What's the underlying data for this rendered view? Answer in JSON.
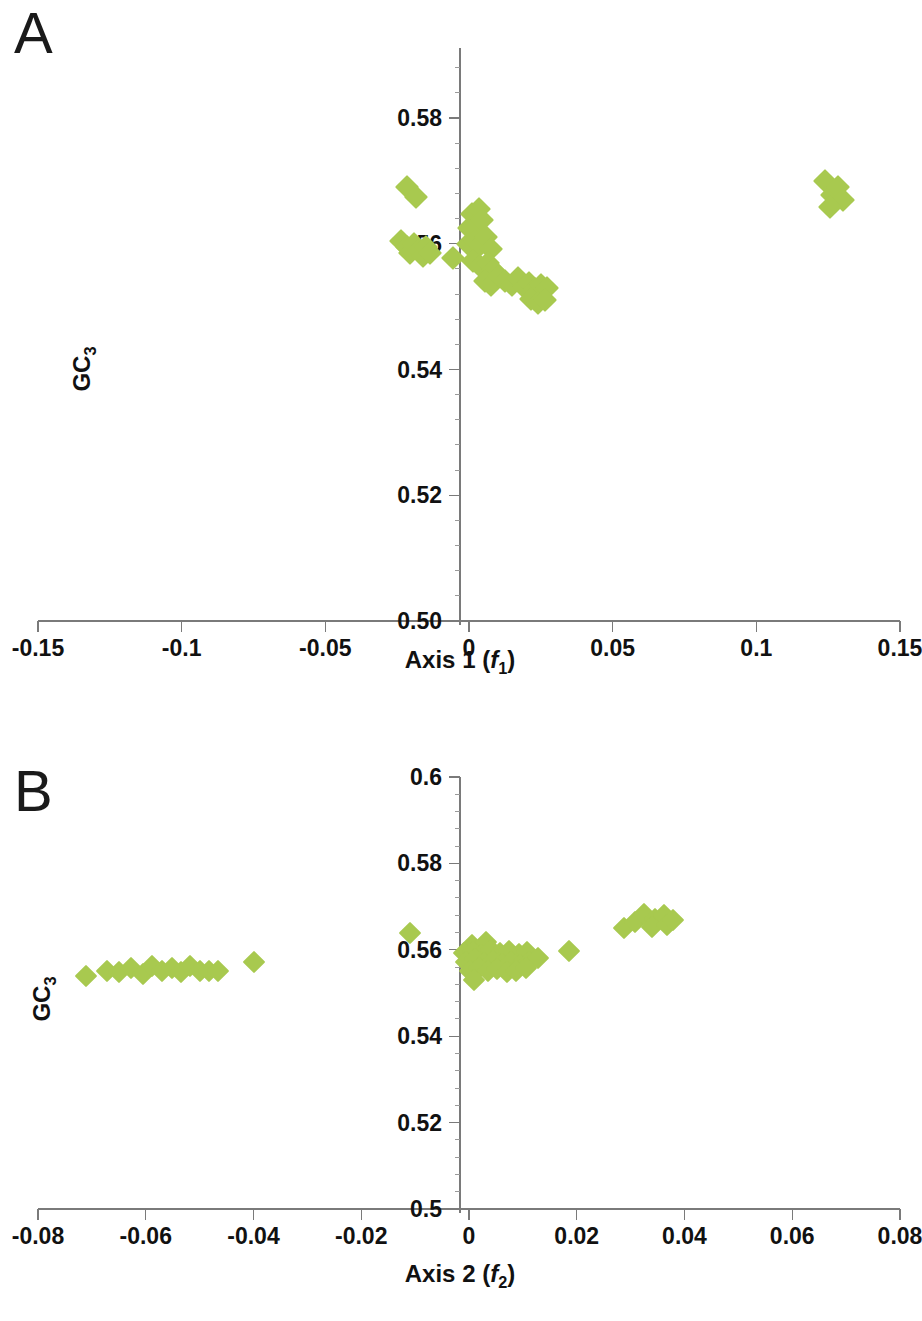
{
  "figure": {
    "marker_color": "#a8c94f",
    "axis_color": "#7a7a7a",
    "text_color": "#111111"
  },
  "panels": [
    {
      "letter": "A",
      "ylabel_text": "GC",
      "ylabel_sub": "3",
      "xtitle_prefix": "Axis 1 (",
      "xtitle_italic": "f",
      "xtitle_sub": "1",
      "xtitle_suffix": ")",
      "xticks": [
        "-0.15",
        "-0.1",
        "-0.05",
        "0",
        "0.05",
        "0.1",
        "0.15"
      ],
      "yticks": [
        "0.58",
        "0.56",
        "0.54",
        "0.52",
        "0.50"
      ]
    },
    {
      "letter": "B",
      "ylabel_text": "GC",
      "ylabel_sub": "3",
      "xtitle_prefix": "Axis 2 (",
      "xtitle_italic": "f",
      "xtitle_sub": "2",
      "xtitle_suffix": ")",
      "xticks": [
        "-0.08",
        "-0.06",
        "-0.04",
        "-0.02",
        "0",
        "0.02",
        "0.04",
        "0.06",
        "0.08"
      ],
      "yticks": [
        "0.6",
        "0.58",
        "0.56",
        "0.54",
        "0.52",
        "0.5"
      ]
    }
  ],
  "chart_data": [
    {
      "type": "scatter",
      "title": "A",
      "xlabel": "Axis 1 (f1)",
      "ylabel": "GC3",
      "xlim": [
        -0.15,
        0.15
      ],
      "ylim": [
        0.5,
        0.588
      ],
      "xticks": [
        -0.15,
        -0.1,
        -0.05,
        0,
        0.05,
        0.1,
        0.15
      ],
      "yticks": [
        0.5,
        0.52,
        0.54,
        0.56,
        0.58
      ],
      "xtick_labels": [
        "-0.15",
        "-0.1",
        "-0.05",
        "0",
        "0.05",
        "0.1",
        "0.15"
      ],
      "ytick_labels": [
        "0.50",
        "0.52",
        "0.54",
        "0.56",
        "0.58"
      ],
      "grid": false,
      "legend": "none",
      "series": [
        {
          "name": "genes",
          "marker": "diamond",
          "color": "#a8c94f",
          "points": [
            [
              -0.0215,
              0.569
            ],
            [
              -0.0185,
              0.5675
            ],
            [
              -0.0235,
              0.5605
            ],
            [
              -0.0215,
              0.5595
            ],
            [
              -0.0205,
              0.5585
            ],
            [
              -0.019,
              0.56
            ],
            [
              -0.0175,
              0.559
            ],
            [
              -0.016,
              0.558
            ],
            [
              -0.015,
              0.5595
            ],
            [
              -0.0135,
              0.5585
            ],
            [
              -0.0055,
              0.5578
            ],
            [
              0.001,
              0.5648
            ],
            [
              0.0035,
              0.5655
            ],
            [
              0.0,
              0.5625
            ],
            [
              0.002,
              0.563
            ],
            [
              0.0045,
              0.5638
            ],
            [
              -0.0005,
              0.56
            ],
            [
              0.002,
              0.5605
            ],
            [
              0.004,
              0.5598
            ],
            [
              0.006,
              0.561
            ],
            [
              0.0075,
              0.5592
            ],
            [
              0.0015,
              0.5572
            ],
            [
              0.004,
              0.5565
            ],
            [
              0.0065,
              0.557
            ],
            [
              0.0085,
              0.5558
            ],
            [
              0.0055,
              0.554
            ],
            [
              0.0075,
              0.5535
            ],
            [
              0.0105,
              0.5548
            ],
            [
              0.0125,
              0.554
            ],
            [
              0.015,
              0.5535
            ],
            [
              0.017,
              0.5545
            ],
            [
              0.019,
              0.5532
            ],
            [
              0.021,
              0.5538
            ],
            [
              0.023,
              0.5528
            ],
            [
              0.025,
              0.5535
            ],
            [
              0.027,
              0.553
            ],
            [
              0.0215,
              0.5512
            ],
            [
              0.024,
              0.5505
            ],
            [
              0.0265,
              0.551
            ],
            [
              0.124,
              0.57
            ],
            [
              0.1265,
              0.5678
            ],
            [
              0.1285,
              0.569
            ],
            [
              0.13,
              0.567
            ],
            [
              0.1255,
              0.5658
            ]
          ]
        }
      ]
    },
    {
      "type": "scatter",
      "title": "B",
      "xlabel": "Axis 2 (f2)",
      "ylabel": "GC3",
      "xlim": [
        -0.08,
        0.08
      ],
      "ylim": [
        0.5,
        0.6
      ],
      "xticks": [
        -0.08,
        -0.06,
        -0.04,
        -0.02,
        0,
        0.02,
        0.04,
        0.06,
        0.08
      ],
      "yticks": [
        0.5,
        0.52,
        0.54,
        0.56,
        0.58,
        0.6
      ],
      "xtick_labels": [
        "-0.08",
        "-0.06",
        "-0.04",
        "-0.02",
        "0",
        "0.02",
        "0.04",
        "0.06",
        "0.08"
      ],
      "ytick_labels": [
        "0.5",
        "0.52",
        "0.54",
        "0.56",
        "0.58",
        "0.6"
      ],
      "grid": false,
      "legend": "none",
      "series": [
        {
          "name": "genes",
          "marker": "diamond",
          "color": "#a8c94f",
          "points": [
            [
              -0.071,
              0.554
            ],
            [
              -0.0672,
              0.5552
            ],
            [
              -0.065,
              0.5548
            ],
            [
              -0.0628,
              0.5558
            ],
            [
              -0.0605,
              0.5545
            ],
            [
              -0.0588,
              0.5562
            ],
            [
              -0.057,
              0.5552
            ],
            [
              -0.0552,
              0.5558
            ],
            [
              -0.0535,
              0.5548
            ],
            [
              -0.0518,
              0.5562
            ],
            [
              -0.05,
              0.5552
            ],
            [
              -0.0482,
              0.555
            ],
            [
              -0.0465,
              0.5552
            ],
            [
              -0.04,
              0.5572
            ],
            [
              -0.011,
              0.564
            ],
            [
              0.0005,
              0.5612
            ],
            [
              0.0032,
              0.5618
            ],
            [
              -0.001,
              0.5592
            ],
            [
              0.0008,
              0.5596
            ],
            [
              0.0022,
              0.5588
            ],
            [
              0.004,
              0.56
            ],
            [
              0.0058,
              0.5592
            ],
            [
              0.0075,
              0.5598
            ],
            [
              0.0092,
              0.559
            ],
            [
              0.0108,
              0.5596
            ],
            [
              -0.0005,
              0.5572
            ],
            [
              0.0012,
              0.5578
            ],
            [
              0.0028,
              0.557
            ],
            [
              0.0045,
              0.5575
            ],
            [
              0.0062,
              0.5568
            ],
            [
              0.0078,
              0.5572
            ],
            [
              0.0095,
              0.5565
            ],
            [
              0.0112,
              0.5572
            ],
            [
              0.0128,
              0.558
            ],
            [
              0.0002,
              0.5552
            ],
            [
              0.0018,
              0.5558
            ],
            [
              0.0035,
              0.555
            ],
            [
              0.0052,
              0.5556
            ],
            [
              0.007,
              0.5548
            ],
            [
              0.0088,
              0.5552
            ],
            [
              0.0105,
              0.5558
            ],
            [
              0.001,
              0.553
            ],
            [
              0.0185,
              0.5598
            ],
            [
              0.0288,
              0.565
            ],
            [
              0.0308,
              0.5665
            ],
            [
              0.0325,
              0.5682
            ],
            [
              0.0345,
              0.5672
            ],
            [
              0.0362,
              0.568
            ],
            [
              0.034,
              0.5652
            ],
            [
              0.0368,
              0.5658
            ],
            [
              0.0378,
              0.5668
            ]
          ]
        }
      ]
    }
  ]
}
